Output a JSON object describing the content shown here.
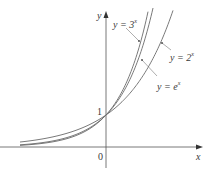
{
  "chart_data": {
    "type": "line",
    "title": "",
    "xlabel": "x",
    "ylabel": "y",
    "series": [
      {
        "name": "y = 3^x",
        "base": 3,
        "x": [
          -3,
          -2,
          -1,
          0,
          1,
          1.3
        ],
        "values": [
          0.037,
          0.111,
          0.333,
          1,
          3,
          4.17
        ]
      },
      {
        "name": "y = e^x",
        "base": 2.718,
        "x": [
          -3,
          -2,
          -1,
          0,
          1,
          1.4
        ],
        "values": [
          0.05,
          0.135,
          0.368,
          1,
          2.718,
          4.06
        ]
      },
      {
        "name": "y = 2^x",
        "base": 2,
        "x": [
          -3,
          -2,
          -1,
          0,
          1,
          2
        ],
        "values": [
          0.125,
          0.25,
          0.5,
          1,
          2,
          4
        ]
      }
    ],
    "annotations": [
      {
        "text": "1",
        "at": [
          0,
          1
        ]
      },
      {
        "text": "0",
        "at": [
          0,
          0
        ]
      }
    ],
    "xlim": [
      -3.3,
      2.9
    ],
    "ylim": [
      -0.7,
      4.2
    ],
    "grid": false,
    "legend": "inline labels with leader lines"
  },
  "labels": {
    "y_axis": "y",
    "x_axis": "x",
    "origin": "0",
    "one": "1",
    "curve_3x": {
      "prefix": "y = 3",
      "exp": "x"
    },
    "curve_2x": {
      "prefix": "y = 2",
      "exp": "x"
    },
    "curve_ex": {
      "prefix": "y = e",
      "exp": "x"
    }
  }
}
